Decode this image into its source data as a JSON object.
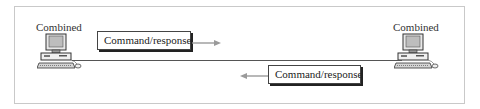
{
  "diagram": {
    "nodes": [
      {
        "id": "left",
        "label": "Combined",
        "icon": "desktop-computer-icon"
      },
      {
        "id": "right",
        "label": "Combined",
        "icon": "desktop-computer-icon"
      }
    ],
    "messages": [
      {
        "label": "Command/response",
        "direction": "left-to-right"
      },
      {
        "label": "Command/response",
        "direction": "right-to-left"
      }
    ],
    "colors": {
      "frame": "#c9c9c9",
      "line": "#555555",
      "arrow": "#9a9a9a",
      "box_border": "#444444",
      "text": "#222222"
    }
  }
}
